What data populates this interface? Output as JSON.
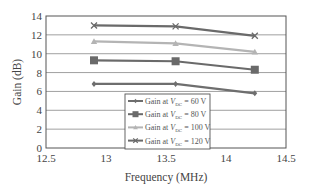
{
  "chart_data": {
    "type": "line",
    "title": "",
    "xlabel": "Frequency (MHz)",
    "ylabel": "Gain (dB)",
    "xlim": [
      12.5,
      14.5
    ],
    "ylim": [
      0,
      14
    ],
    "x_ticks": [
      "12.5",
      "13",
      "13.5",
      "14",
      "14.5"
    ],
    "y_ticks": [
      "0",
      "2",
      "4",
      "6",
      "8",
      "10",
      "12",
      "14"
    ],
    "grid": "horizontal",
    "legend_position": "lower center (inside plot)",
    "x": [
      12.9,
      13.58,
      14.24
    ],
    "series": [
      {
        "name": "Gain at V_DC = 60 V",
        "legend_prefix": "Gain at ",
        "legend_var": "V",
        "legend_sub": "DC",
        "legend_suffix": " = 60 V",
        "marker": "diamond",
        "color": "#6e6e6e",
        "values": [
          6.8,
          6.8,
          5.8
        ]
      },
      {
        "name": "Gain at V_DC = 80 V",
        "legend_prefix": "Gain at ",
        "legend_var": "V",
        "legend_sub": "DC",
        "legend_suffix": " = 80 V",
        "marker": "square",
        "color": "#6a6a6a",
        "values": [
          9.3,
          9.2,
          8.3
        ]
      },
      {
        "name": "Gain at V_DC = 100 V",
        "legend_prefix": "Gain at ",
        "legend_var": "V",
        "legend_sub": "DC",
        "legend_suffix": " = 100 V",
        "marker": "triangle",
        "color": "#b4b4b4",
        "values": [
          11.3,
          11.1,
          10.2
        ]
      },
      {
        "name": "Gain at V_DC = 120 V",
        "legend_prefix": "Gain at ",
        "legend_var": "V",
        "legend_sub": "DC",
        "legend_suffix": " = 120 V",
        "marker": "x",
        "color": "#6a6a6a",
        "values": [
          13.0,
          12.9,
          11.9
        ]
      }
    ]
  }
}
